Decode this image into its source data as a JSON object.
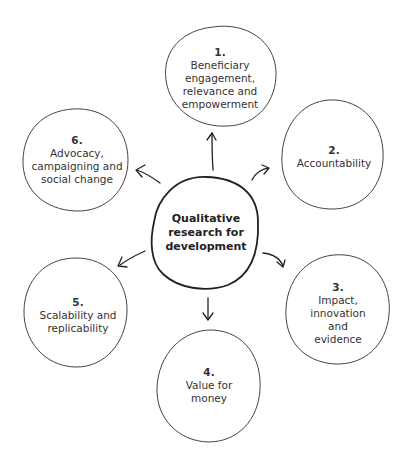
{
  "diagram": {
    "center": {
      "text_lines": [
        "Qualitative",
        "research for",
        "development"
      ]
    },
    "nodes": [
      {
        "number": "1.",
        "lines": [
          "Beneficiary",
          "engagement,",
          "relevance and",
          "empowerment"
        ]
      },
      {
        "number": "2.",
        "lines": [
          "Accountability"
        ]
      },
      {
        "number": "3.",
        "lines": [
          "Impact,",
          "innovation and",
          "evidence"
        ]
      },
      {
        "number": "4.",
        "lines": [
          "Value for",
          "money"
        ]
      },
      {
        "number": "5.",
        "lines": [
          "Scalability and",
          "replicability"
        ]
      },
      {
        "number": "6.",
        "lines": [
          "Advocacy,",
          "campaigning and",
          "social change"
        ]
      }
    ]
  }
}
